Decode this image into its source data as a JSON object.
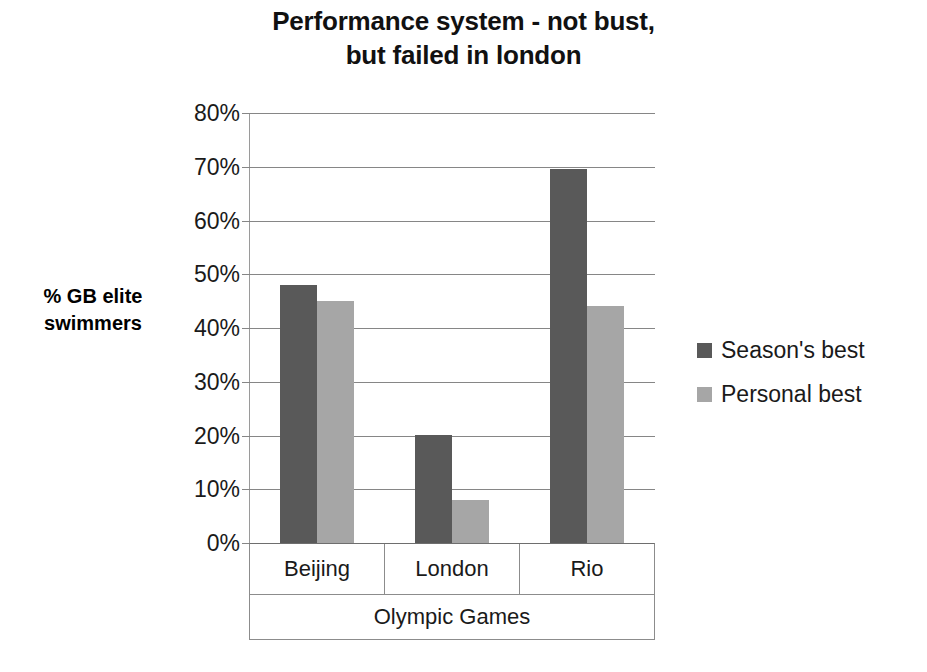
{
  "chart_data": {
    "type": "bar",
    "title": "Performance system - not bust, but failed in london",
    "title_lines": [
      "Performance system - not bust,",
      "but failed in london"
    ],
    "xlabel": "Olympic Games",
    "ylabel": "% GB elite swimmers",
    "ylabel_lines": [
      "% GB elite",
      "swimmers"
    ],
    "categories": [
      "Beijing",
      "London",
      "Rio"
    ],
    "series": [
      {
        "name": "Season's best",
        "values": [
          48,
          20,
          69.5
        ],
        "color": "#595959"
      },
      {
        "name": "Personal best",
        "values": [
          45,
          8,
          44
        ],
        "color": "#a6a6a6"
      }
    ],
    "ylim": [
      0,
      80
    ],
    "ytick_values": [
      80,
      70,
      60,
      50,
      40,
      30,
      20,
      10,
      0
    ],
    "ytick_labels": [
      "80%",
      "70%",
      "60%",
      "50%",
      "40%",
      "30%",
      "20%",
      "10%",
      "0%"
    ],
    "grid": true,
    "grid_axis": "y",
    "legend_position": "right",
    "legend_entries": [
      "Season's best",
      "Personal best"
    ],
    "value_format": "percent"
  }
}
